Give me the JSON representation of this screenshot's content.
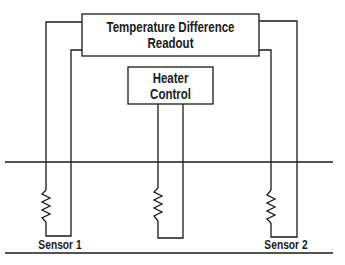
{
  "diagram": {
    "readout": {
      "line1": "Temperature Difference",
      "line2": "Readout"
    },
    "heater": {
      "line1": "Heater",
      "line2": "Control"
    },
    "sensors": [
      {
        "label": "Sensor 1"
      },
      {
        "label": "Sensor 2"
      }
    ],
    "colors": {
      "stroke": "#1a1a1a",
      "background": "#ffffff"
    }
  }
}
